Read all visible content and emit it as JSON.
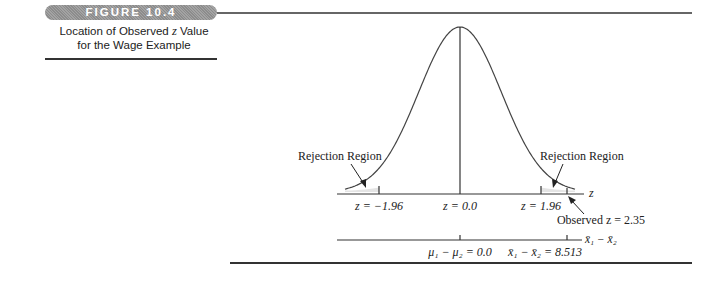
{
  "figure": {
    "number_label": "FIGURE 10.4",
    "caption_line1_pre": "Location of Observed ",
    "caption_line1_var": "z",
    "caption_line1_post": " Value",
    "caption_line2": "for the Wage Example"
  },
  "diagram": {
    "left_region_label": "Rejection Region",
    "right_region_label": "Rejection Region",
    "z_axis_label": "z",
    "z_ticks": {
      "left_critical": "z = −1.96",
      "center": "z = 0.0",
      "right_critical": "z = 1.96"
    },
    "observed_label": "Observed z = 2.35",
    "lower_axis_label": "x̄₁ − x̄₂",
    "lower_ticks": {
      "center": "μ₁ − μ₂ = 0.0",
      "observed": "x̄₁ − x̄₂ = 8.513"
    }
  },
  "chart_data": {
    "type": "normal-curve",
    "title": "Location of Observed z Value for the Wage Example",
    "distribution": "standard normal",
    "critical_values": [
      -1.96,
      1.96
    ],
    "observed_z": 2.35,
    "rejection_regions": [
      "z < -1.96",
      "z > 1.96"
    ],
    "upper_axis": {
      "label": "z",
      "ticks": [
        -1.96,
        0.0,
        1.96
      ]
    },
    "lower_axis": {
      "label": "x̄1 − x̄2",
      "ticks": [
        {
          "label": "μ1 − μ2",
          "value": 0.0
        },
        {
          "label": "x̄1 − x̄2",
          "value": 8.513
        }
      ]
    }
  },
  "colors": {
    "badge": "#999999",
    "ink": "#222222",
    "shading": "#e6e6e6"
  }
}
